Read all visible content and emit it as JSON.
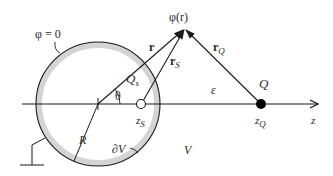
{
  "diagram": {
    "type": "physics-schematic",
    "colors": {
      "line": "#1a1a1a",
      "sphere_shade": "#d4d4d4",
      "text": "#2a2a2a",
      "charge_fill": "#000000",
      "image_charge_fill": "#ffffff"
    },
    "labels": {
      "potential_boundary": "φ = 0",
      "field_point": "φ(r)",
      "vec_r": "r",
      "vec_rS": "r",
      "vec_rS_sub": "S",
      "vec_rQ": "r",
      "vec_rQ_sub": "Q",
      "angle": "θ",
      "image_charge": "Q",
      "image_charge_sub": "s",
      "image_pos": "z",
      "image_pos_sub": "S",
      "charge": "Q",
      "charge_pos": "z",
      "charge_pos_sub": "Q",
      "axis": "z",
      "permittivity": "ε",
      "radius": "R",
      "surface": "∂V",
      "volume": "V"
    }
  }
}
